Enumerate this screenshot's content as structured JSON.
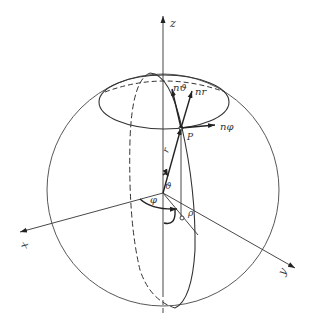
{
  "figure": {
    "axes": {
      "z_label": "z",
      "x_label": "x",
      "y_label": "y"
    },
    "point_label": "P",
    "radius_label": "r",
    "polar_angle_label": "ϑ",
    "azimuth_angle_label": "φ",
    "projection_label": "ρ",
    "unit_vectors": {
      "n_theta": "nϑ",
      "n_r": "nr",
      "n_phi": "nφ"
    },
    "colors": {
      "line": "#333333",
      "background": "#ffffff"
    }
  }
}
